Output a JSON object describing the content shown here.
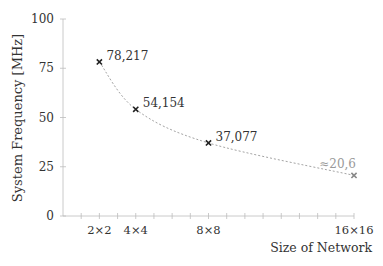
{
  "chart_data": {
    "type": "line",
    "title": "",
    "xlabel": "Size of Network",
    "ylabel": "System Frequency [MHz]",
    "x": [
      2,
      4,
      8,
      16
    ],
    "categories": [
      "2×2",
      "4×4",
      "8×8",
      "16×16"
    ],
    "series": [
      {
        "name": "System Frequency",
        "values": [
          78.217,
          54.154,
          37.077,
          20.6
        ],
        "labels": [
          "78,217",
          "54,154",
          "37,077",
          "≈20,6"
        ],
        "estimated": [
          false,
          false,
          false,
          true
        ],
        "line_style": "dashed fit curve"
      }
    ],
    "xlim": [
      0,
      16
    ],
    "ylim": [
      0,
      100
    ],
    "yticks": [
      0,
      25,
      50,
      75,
      100
    ],
    "xticks_minor_step": 1,
    "grid": false,
    "legend": "none"
  },
  "axes": {
    "y_ticks": [
      "0",
      "25",
      "50",
      "75",
      "100"
    ],
    "x_ticks": [
      "2×2",
      "4×4",
      "8×8",
      "16×16"
    ]
  },
  "colors": {
    "axis": "#bdbdbd",
    "marker": "#222222",
    "marker_estimated": "#888888",
    "curve": "#999999",
    "text": "#333333",
    "text_estimated": "#999999"
  }
}
